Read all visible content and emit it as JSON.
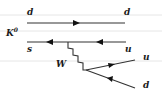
{
  "diagram": {
    "type": "feynman-diagram",
    "meson": {
      "label": "K",
      "superscript": "0"
    },
    "quark_lines": [
      {
        "id": "top",
        "left_label": "d",
        "right_label": "d",
        "arrow_direction": "right"
      },
      {
        "id": "bottom",
        "left_label": "s",
        "right_label": "u",
        "arrow_direction": "left"
      }
    ],
    "boson": {
      "label": "W"
    },
    "outgoing": [
      {
        "label": "u",
        "arrow_direction": "outward"
      },
      {
        "label": "d",
        "arrow_direction": "inward"
      }
    ]
  },
  "colors": {
    "line": "#333333",
    "arrow": "#111111",
    "background_rule": "#e6e6e6",
    "text": "#1a1a1a"
  }
}
